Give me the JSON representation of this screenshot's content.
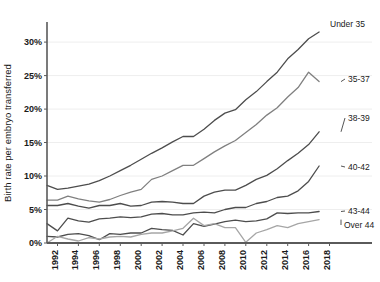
{
  "chart_data": {
    "type": "line",
    "title": "",
    "xlabel": "",
    "ylabel": "Birth rate per embryo transferred",
    "ylim": [
      0,
      33
    ],
    "ytick_values": [
      0,
      5,
      10,
      15,
      20,
      25,
      30
    ],
    "ytick_labels": [
      "0%",
      "5%",
      "10%",
      "15%",
      "20%",
      "25%",
      "30%"
    ],
    "xlim": [
      1991,
      2019
    ],
    "xtick_values": [
      1992,
      1994,
      1996,
      1998,
      2000,
      2002,
      2004,
      2006,
      2008,
      2010,
      2012,
      2014,
      2016,
      2018
    ],
    "xtick_labels": [
      "1992",
      "1994",
      "1996",
      "1998",
      "2000",
      "2002",
      "2004",
      "2006",
      "2008",
      "2010",
      "2012",
      "2014",
      "2016",
      "2018"
    ],
    "grid": "horizontal",
    "legend_position": "right-inline-labels",
    "x": [
      1991,
      1992,
      1993,
      1994,
      1995,
      1996,
      1997,
      1998,
      1999,
      2000,
      2001,
      2002,
      2003,
      2004,
      2005,
      2006,
      2007,
      2008,
      2009,
      2010,
      2011,
      2012,
      2013,
      2014,
      2015,
      2016,
      2017
    ],
    "series": [
      {
        "name": "Under 35",
        "color": "#4d4d4d",
        "values": [
          8.6,
          8.0,
          8.2,
          8.5,
          8.8,
          9.3,
          10.0,
          10.8,
          11.6,
          12.5,
          13.4,
          14.2,
          15.1,
          15.9,
          15.9,
          17.0,
          18.3,
          19.4,
          19.9,
          21.4,
          22.6,
          24.1,
          25.5,
          27.5,
          28.9,
          30.5,
          31.5
        ]
      },
      {
        "name": "35-37",
        "color": "#808080",
        "values": [
          6.4,
          6.4,
          7.0,
          6.6,
          6.3,
          6.1,
          6.5,
          7.1,
          7.6,
          8.0,
          9.5,
          10.0,
          10.8,
          11.6,
          11.6,
          12.6,
          13.6,
          14.5,
          15.3,
          16.5,
          17.7,
          19.1,
          20.2,
          21.8,
          23.2,
          25.5,
          24.1
        ]
      },
      {
        "name": "38-39",
        "color": "#4d4d4d",
        "values": [
          5.6,
          5.6,
          5.9,
          5.5,
          5.2,
          5.6,
          5.6,
          5.9,
          5.5,
          5.6,
          6.1,
          6.2,
          6.1,
          5.9,
          5.9,
          7.0,
          7.6,
          7.9,
          7.9,
          8.6,
          9.5,
          10.1,
          11.1,
          12.3,
          13.4,
          14.7,
          16.6
        ]
      },
      {
        "name": "40-42",
        "color": "#4d4d4d",
        "values": [
          2.9,
          1.8,
          3.7,
          3.3,
          3.1,
          3.6,
          3.7,
          3.9,
          3.8,
          3.9,
          4.3,
          4.4,
          4.2,
          4.2,
          4.5,
          4.6,
          4.5,
          5.0,
          5.3,
          5.3,
          5.9,
          6.2,
          6.8,
          7.0,
          7.8,
          9.2,
          11.5
        ]
      },
      {
        "name": "43-44",
        "color": "#4d4d4d",
        "values": [
          1.0,
          0.9,
          1.3,
          1.4,
          1.1,
          0.5,
          1.4,
          1.3,
          1.5,
          1.5,
          2.2,
          2.0,
          1.9,
          1.2,
          2.9,
          2.5,
          2.8,
          3.2,
          3.4,
          3.2,
          3.3,
          3.6,
          4.5,
          4.4,
          4.5,
          4.5,
          4.7
        ]
      },
      {
        "name": "Over 44",
        "color": "#a6a6a6",
        "values": [
          0.0,
          1.0,
          0.6,
          0.3,
          0.8,
          0.6,
          0.9,
          1.0,
          0.9,
          1.3,
          1.5,
          1.5,
          1.8,
          2.2,
          3.7,
          2.6,
          2.9,
          2.3,
          2.3,
          0.1,
          1.5,
          2.0,
          2.6,
          2.3,
          2.9,
          3.2,
          3.5
        ]
      }
    ],
    "series_labels": [
      {
        "name": "Under 35",
        "y_pct": 31.5
      },
      {
        "name": "35-37",
        "y_pct": 25.0
      },
      {
        "name": "38-39",
        "y_pct": 18.5
      },
      {
        "name": "40-42",
        "y_pct": 11.5
      },
      {
        "name": "43-44",
        "y_pct": 4.8
      },
      {
        "name": "Over 44",
        "y_pct": 3.2
      }
    ]
  }
}
